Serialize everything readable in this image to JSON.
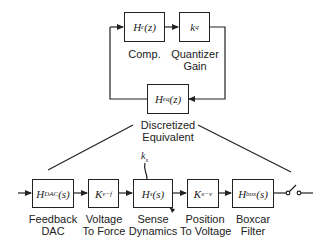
{
  "diagram": {
    "top_loop": {
      "blocks": [
        {
          "id": "compensator",
          "expr_main": "H",
          "expr_sub": "c",
          "expr_arg": "(z)",
          "label": "Comp."
        },
        {
          "id": "quantizer",
          "expr_main": "k",
          "expr_sub": "q",
          "expr_arg": "",
          "label_line1": "Quantizer",
          "label_line2": "Gain"
        },
        {
          "id": "discretized",
          "expr_main": "H",
          "expr_sub": "eq",
          "expr_arg": "(z)",
          "label_line1": "Discretized",
          "label_line2": "Equivalent"
        }
      ]
    },
    "bottom_chain": {
      "blocks": [
        {
          "id": "feedback-dac",
          "expr_main": "H",
          "expr_sub": "DAC",
          "expr_arg": "(s)",
          "label_line1": "Feedback",
          "label_line2": "DAC"
        },
        {
          "id": "voltage-to-force",
          "expr_main": "K",
          "expr_sub": "v−f",
          "expr_arg": "",
          "label_line1": "Voltage",
          "label_line2": "To Force"
        },
        {
          "id": "sense-dynamics",
          "expr_main": "H",
          "expr_sub": "s",
          "expr_arg": "(s)",
          "label_line1": "Sense",
          "label_line2": "Dynamics"
        },
        {
          "id": "position-to-voltage",
          "expr_main": "K",
          "expr_sub": "x−v",
          "expr_arg": "",
          "label_line1": "Position",
          "label_line2": "To Voltage"
        },
        {
          "id": "boxcar-filter",
          "expr_main": "H",
          "expr_sub": "box",
          "expr_arg": "(s)",
          "label_line1": "Boxcar",
          "label_line2": "Filter"
        }
      ],
      "parameter_label": "k",
      "parameter_sub": "s"
    }
  }
}
